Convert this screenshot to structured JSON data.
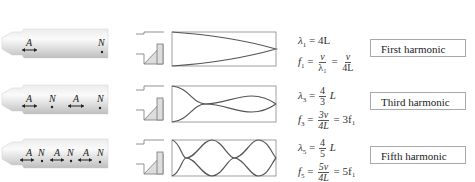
{
  "rows": [
    {
      "tube_labels": [
        "A",
        "N"
      ],
      "lambda": {
        "symbol": "λ",
        "sub": "1",
        "rhs": "= 4L"
      },
      "freq": {
        "symbol": "f",
        "sub": "1",
        "eq1": "=",
        "num1": "v",
        "den1": "λ₁",
        "eq2": "=",
        "num2": "v",
        "den2": "4L"
      },
      "label": "First harmonic"
    },
    {
      "tube_labels": [
        "A",
        "N",
        "A",
        "N"
      ],
      "lambda": {
        "symbol": "λ",
        "sub": "3",
        "eq": "=",
        "num": "4",
        "den": "3",
        "tail": "L"
      },
      "freq": {
        "symbol": "f",
        "sub": "3",
        "eq1": "=",
        "num": "3v",
        "den": "4L",
        "tail": "= 3f₁"
      },
      "label": "Third harmonic"
    },
    {
      "tube_labels": [
        "A",
        "N",
        "A",
        "N",
        "A",
        "N"
      ],
      "lambda": {
        "symbol": "λ",
        "sub": "5",
        "eq": "=",
        "num": "4",
        "den": "5",
        "tail": "L"
      },
      "freq": {
        "symbol": "f",
        "sub": "5",
        "eq1": "=",
        "num": "5v",
        "den": "4L",
        "tail": "= 5f₁"
      },
      "label": "Fifth harmonic"
    }
  ],
  "colors": {
    "tube": "#d8d8d8",
    "wave": "#555555",
    "box": "#888888",
    "reed": "#d0d0d0"
  }
}
